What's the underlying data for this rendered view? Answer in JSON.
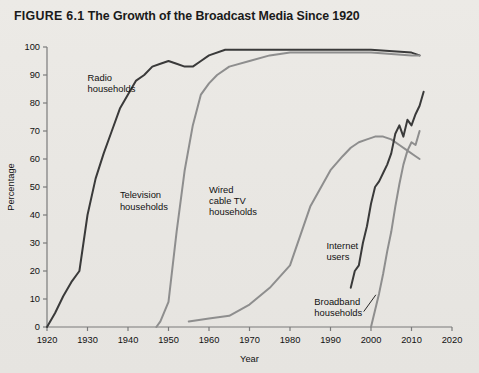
{
  "figure": {
    "label": "FIGURE 6.1",
    "title": "The Growth of the Broadcast Media Since 1920",
    "full_title": "FIGURE 6.1 The Growth of the Broadcast Media Since 1920"
  },
  "colors": {
    "background": "#e9e7e3",
    "dark_series": "#3a3a3a",
    "gray_series": "#8e8e8e",
    "axis": "#7b7b7b",
    "text": "#111111"
  },
  "chart_data": {
    "type": "line",
    "title": "FIGURE 6.1 The Growth of the Broadcast Media Since 1920",
    "xlabel": "Year",
    "ylabel": "Percentage",
    "xlim": [
      1920,
      2020
    ],
    "ylim": [
      0,
      100
    ],
    "xticks": [
      1920,
      1930,
      1940,
      1950,
      1960,
      1970,
      1980,
      1990,
      2000,
      2010,
      2020
    ],
    "yticks": [
      0,
      10,
      20,
      30,
      40,
      50,
      60,
      70,
      80,
      90,
      100
    ],
    "grid": false,
    "legend": "inline-annotations",
    "series": [
      {
        "name": "Radio households",
        "color": "#3a3a3a",
        "label_x": 1930,
        "label_y": 88,
        "points": [
          [
            1920,
            0
          ],
          [
            1922,
            5
          ],
          [
            1924,
            11
          ],
          [
            1926,
            16
          ],
          [
            1928,
            20
          ],
          [
            1930,
            40
          ],
          [
            1932,
            53
          ],
          [
            1934,
            62
          ],
          [
            1936,
            70
          ],
          [
            1938,
            78
          ],
          [
            1940,
            83
          ],
          [
            1942,
            88
          ],
          [
            1944,
            90
          ],
          [
            1946,
            93
          ],
          [
            1948,
            94
          ],
          [
            1950,
            95
          ],
          [
            1952,
            94
          ],
          [
            1954,
            93
          ],
          [
            1956,
            93
          ],
          [
            1958,
            95
          ],
          [
            1960,
            97
          ],
          [
            1964,
            99
          ],
          [
            1970,
            99
          ],
          [
            1980,
            99
          ],
          [
            1990,
            99
          ],
          [
            2000,
            99
          ],
          [
            2010,
            98
          ],
          [
            2012,
            97
          ]
        ]
      },
      {
        "name": "Television households",
        "color": "#8e8e8e",
        "label_x": 1938,
        "label_y": 46,
        "points": [
          [
            1947,
            0
          ],
          [
            1948,
            2
          ],
          [
            1950,
            9
          ],
          [
            1952,
            34
          ],
          [
            1954,
            56
          ],
          [
            1956,
            72
          ],
          [
            1958,
            83
          ],
          [
            1960,
            87
          ],
          [
            1962,
            90
          ],
          [
            1965,
            93
          ],
          [
            1970,
            95
          ],
          [
            1975,
            97
          ],
          [
            1980,
            98
          ],
          [
            1990,
            98
          ],
          [
            2000,
            98
          ],
          [
            2010,
            97
          ],
          [
            2012,
            97
          ]
        ]
      },
      {
        "name": "Wired cable TV households",
        "color": "#8e8e8e",
        "label_x": 1960,
        "label_y": 48,
        "points": [
          [
            1955,
            2
          ],
          [
            1960,
            3
          ],
          [
            1965,
            4
          ],
          [
            1970,
            8
          ],
          [
            1975,
            14
          ],
          [
            1980,
            22
          ],
          [
            1985,
            43
          ],
          [
            1990,
            56
          ],
          [
            1993,
            61
          ],
          [
            1995,
            64
          ],
          [
            1997,
            66
          ],
          [
            1999,
            67
          ],
          [
            2001,
            68
          ],
          [
            2003,
            68
          ],
          [
            2005,
            67
          ],
          [
            2007,
            65
          ],
          [
            2009,
            63
          ],
          [
            2011,
            61
          ],
          [
            2012,
            60
          ]
        ]
      },
      {
        "name": "Internet users",
        "color": "#3a3a3a",
        "label_x": 1989,
        "label_y": 28,
        "points": [
          [
            1995,
            14
          ],
          [
            1996,
            20
          ],
          [
            1997,
            22
          ],
          [
            1998,
            30
          ],
          [
            1999,
            36
          ],
          [
            2000,
            44
          ],
          [
            2001,
            50
          ],
          [
            2002,
            52
          ],
          [
            2003,
            55
          ],
          [
            2004,
            58
          ],
          [
            2005,
            62
          ],
          [
            2006,
            69
          ],
          [
            2007,
            72
          ],
          [
            2008,
            68
          ],
          [
            2009,
            74
          ],
          [
            2010,
            72
          ],
          [
            2011,
            76
          ],
          [
            2012,
            79
          ],
          [
            2013,
            84
          ]
        ]
      },
      {
        "name": "Broadband households",
        "color": "#8e8e8e",
        "label_x": 1986,
        "label_y": 8,
        "points": [
          [
            2000,
            0
          ],
          [
            2001,
            6
          ],
          [
            2002,
            12
          ],
          [
            2003,
            19
          ],
          [
            2004,
            27
          ],
          [
            2005,
            34
          ],
          [
            2006,
            43
          ],
          [
            2007,
            51
          ],
          [
            2008,
            58
          ],
          [
            2009,
            63
          ],
          [
            2010,
            66
          ],
          [
            2011,
            65
          ],
          [
            2012,
            70
          ]
        ]
      }
    ]
  }
}
